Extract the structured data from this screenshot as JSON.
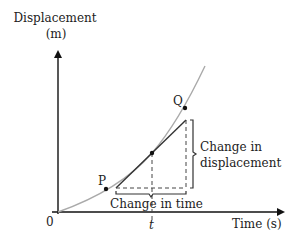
{
  "diagram": {
    "y_axis": {
      "label_line1": "Displacement",
      "label_line2": "(m)"
    },
    "x_axis": {
      "label": "Time (s)",
      "origin_label": "0",
      "tick_label": "t"
    },
    "points": {
      "p_label": "P",
      "q_label": "Q"
    },
    "annotations": {
      "displacement_line1": "Change in",
      "displacement_line2": "displacement",
      "time": "Change in time"
    },
    "colors": {
      "axis": "#111111",
      "curve": "#aaaaaa",
      "tangent": "#333333",
      "dashed": "#444444",
      "text": "#222222"
    }
  }
}
